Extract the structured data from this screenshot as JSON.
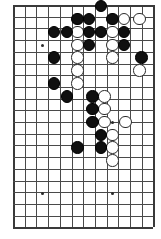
{
  "figure": {
    "type": "go-board-diagram"
  },
  "board": {
    "columns": 12,
    "rows": 19,
    "left_px": 13,
    "top_px": 5,
    "spacing_x_px": 11.7,
    "spacing_y_px": 11.7,
    "line_color": "#4a4a4a",
    "edge_color": "#3a3a3a",
    "background_color": "#ffffff",
    "star_point_color": "#2a2a2a",
    "black_color": "#101010",
    "white_color": "#ffffff",
    "white_border_color": "#2b2b2b",
    "stone_diameter_px": 12.5
  },
  "star_points": [
    {
      "col": 2.5,
      "row": 3.4
    },
    {
      "col": 8.5,
      "row": 3.4
    },
    {
      "col": 8.5,
      "row": 10.0
    },
    {
      "col": 2.5,
      "row": 16.1
    },
    {
      "col": 8.5,
      "row": 16.1
    }
  ],
  "stones": [
    {
      "color": "black",
      "col": 7.5,
      "row": 0.1
    },
    {
      "color": "black",
      "col": 5.5,
      "row": 1.2
    },
    {
      "color": "black",
      "col": 6.5,
      "row": 1.2
    },
    {
      "color": "black",
      "col": 8.5,
      "row": 1.2
    },
    {
      "color": "white",
      "col": 9.5,
      "row": 1.2
    },
    {
      "color": "white",
      "col": 10.8,
      "row": 1.2
    },
    {
      "color": "black",
      "col": 3.5,
      "row": 2.3
    },
    {
      "color": "black",
      "col": 4.6,
      "row": 2.3
    },
    {
      "color": "white",
      "col": 5.5,
      "row": 2.3
    },
    {
      "color": "black",
      "col": 6.5,
      "row": 2.3
    },
    {
      "color": "black",
      "col": 7.5,
      "row": 2.3
    },
    {
      "color": "white",
      "col": 8.5,
      "row": 2.3
    },
    {
      "color": "black",
      "col": 9.5,
      "row": 2.3
    },
    {
      "color": "white",
      "col": 5.5,
      "row": 3.4
    },
    {
      "color": "black",
      "col": 6.5,
      "row": 3.4
    },
    {
      "color": "white",
      "col": 8.5,
      "row": 3.4
    },
    {
      "color": "black",
      "col": 9.5,
      "row": 3.4
    },
    {
      "color": "black",
      "col": 3.5,
      "row": 4.5
    },
    {
      "color": "white",
      "col": 5.5,
      "row": 4.5
    },
    {
      "color": "white",
      "col": 8.5,
      "row": 4.5
    },
    {
      "color": "black",
      "col": 11.0,
      "row": 4.5
    },
    {
      "color": "white",
      "col": 5.5,
      "row": 5.6
    },
    {
      "color": "white",
      "col": 10.8,
      "row": 5.6
    },
    {
      "color": "black",
      "col": 3.5,
      "row": 6.7
    },
    {
      "color": "white",
      "col": 5.5,
      "row": 6.7
    },
    {
      "color": "black",
      "col": 4.6,
      "row": 7.8
    },
    {
      "color": "black",
      "col": 6.8,
      "row": 7.8
    },
    {
      "color": "white",
      "col": 7.8,
      "row": 7.8
    },
    {
      "color": "black",
      "col": 6.8,
      "row": 8.9
    },
    {
      "color": "white",
      "col": 7.8,
      "row": 8.9
    },
    {
      "color": "black",
      "col": 6.8,
      "row": 10.0
    },
    {
      "color": "white",
      "col": 7.8,
      "row": 10.0
    },
    {
      "color": "white",
      "col": 9.6,
      "row": 10.0
    },
    {
      "color": "black",
      "col": 7.5,
      "row": 11.1
    },
    {
      "color": "white",
      "col": 8.5,
      "row": 11.1
    },
    {
      "color": "black",
      "col": 5.5,
      "row": 12.2
    },
    {
      "color": "black",
      "col": 7.5,
      "row": 12.2
    },
    {
      "color": "white",
      "col": 8.5,
      "row": 12.2
    },
    {
      "color": "white",
      "col": 8.5,
      "row": 13.3
    }
  ]
}
